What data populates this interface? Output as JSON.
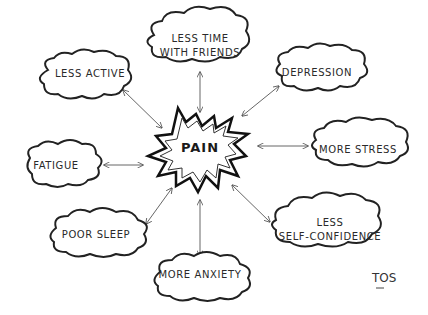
{
  "center": {
    "label": "PAIN",
    "shape": "starburst"
  },
  "nodes": [
    {
      "id": "less-active",
      "label_lines": [
        "LESS ACTIVE"
      ]
    },
    {
      "id": "less-time-friends",
      "label_lines": [
        "LESS TIME",
        "WITH FRIENDS"
      ]
    },
    {
      "id": "depression",
      "label_lines": [
        "DEPRESSION"
      ]
    },
    {
      "id": "more-stress",
      "label_lines": [
        "MORE STRESS"
      ]
    },
    {
      "id": "less-self-confidence",
      "label_lines": [
        "LESS",
        "SELF-CONFIDENCE"
      ]
    },
    {
      "id": "more-anxiety",
      "label_lines": [
        "MORE ANXIETY"
      ]
    },
    {
      "id": "poor-sleep",
      "label_lines": [
        "POOR SLEEP"
      ]
    },
    {
      "id": "fatigue",
      "label_lines": [
        "FATIGUE"
      ]
    }
  ],
  "edges": "bidirectional arrows from PAIN to each node",
  "signature": "TOS",
  "colors": {
    "stroke": "#222222",
    "background": "#ffffff"
  }
}
